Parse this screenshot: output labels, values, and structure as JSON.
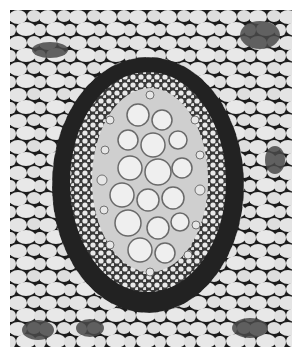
{
  "image": {
    "description": "Black-and-white light micrograph of a plant stem cross-section showing a concentric vascular bundle",
    "subject": "vascular bundle cross-section",
    "colors": {
      "background": "#ffffff",
      "cell_lumen": "#e6e6e6",
      "cell_wall": "#1a1a1a",
      "sheath": "#262626",
      "xylem_vessel": "#ececec",
      "ground_tissue_dark": "#5a5a5a"
    },
    "regions": [
      {
        "name": "parenchyma",
        "description": "large polygonal ground-tissue cells with dark walls filling the outer field"
      },
      {
        "name": "sheath",
        "description": "dark thick-walled oval ring (sclerenchyma/endodermis) surrounding the bundle"
      },
      {
        "name": "phloem",
        "description": "small densely packed cells forming a ring inside the sheath"
      },
      {
        "name": "xylem",
        "description": "large rounded pale vessels clustered in the center of the oval"
      }
    ]
  }
}
